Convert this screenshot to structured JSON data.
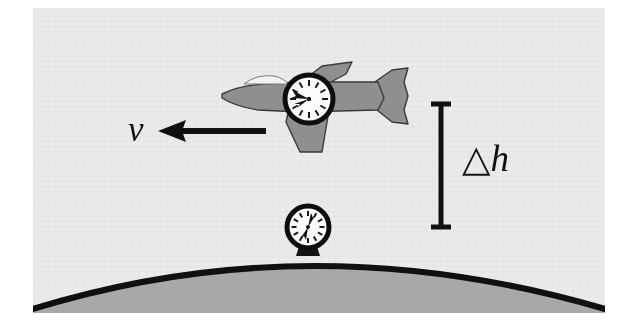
{
  "figure": {
    "background_color": "#ebebeb",
    "page_color": "#ffffff",
    "ink_color": "#111111",
    "earth_fill_color": "#a8a8a8",
    "plane_fill_color": "#8f8f8f",
    "clock_face_color": "#fbfbfb"
  },
  "labels": {
    "velocity": "v",
    "altitude_difference": "△h"
  },
  "annotations": {
    "velocity_arrow": {
      "name": "velocity-arrow",
      "direction": "left",
      "from_x": 266,
      "to_x": 160,
      "y": 131
    },
    "altitude_bracket": {
      "name": "altitude-bracket",
      "x": 441,
      "top_y": 103,
      "bottom_y": 228,
      "cap_half_width": 10
    }
  },
  "objects": {
    "airplane": {
      "name": "airplane",
      "center_x": 310,
      "center_y": 98,
      "heading": "left"
    },
    "airplane_clock": {
      "name": "airplane-clock",
      "center_x": 309,
      "center_y": 99,
      "radius": 24,
      "hour_hand_angle_deg": 255,
      "minute_hand_angle_deg": 290,
      "tick_count": 12
    },
    "ground_clock": {
      "name": "ground-clock",
      "center_x": 308,
      "center_y": 227,
      "radius": 21,
      "hour_hand_angle_deg": 205,
      "minute_hand_angle_deg": 30,
      "tick_count": 12
    },
    "earth": {
      "name": "earth-surface",
      "apex_x": 312,
      "apex_y": 253,
      "left_x": 35,
      "left_y": 307,
      "right_x": 603,
      "right_y": 307,
      "stroke_width": 6
    }
  }
}
